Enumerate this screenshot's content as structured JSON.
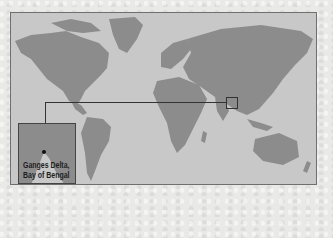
{
  "map": {
    "title": "World map",
    "colors": {
      "ocean": "#c8c8c8",
      "land": "#8c8c8c",
      "frame": "#6f6f6f",
      "background": "#e9e9e7"
    },
    "highlight": {
      "region": "Ganges Delta"
    }
  },
  "inset": {
    "caption_line1": "Ganges Delta,",
    "caption_line2": "Bay of Bengal",
    "marker": "location-dot"
  }
}
